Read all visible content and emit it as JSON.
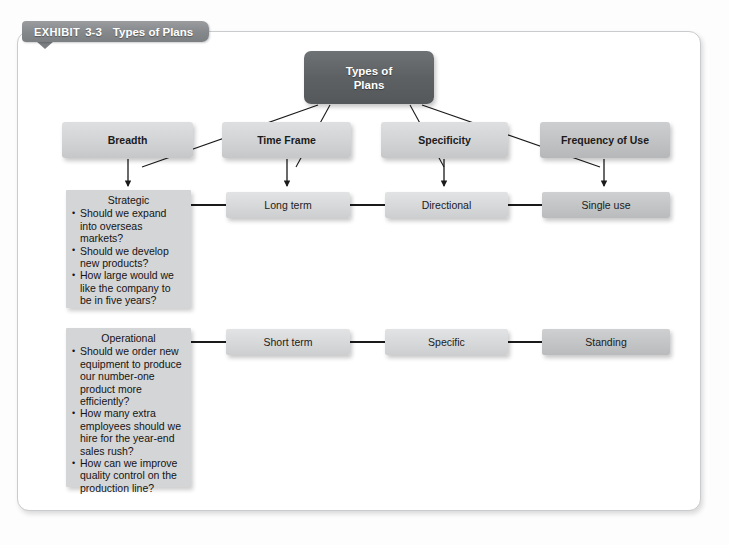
{
  "exhibit": {
    "label": "EXHIBIT",
    "number": "3-3",
    "title": "Types of Plans"
  },
  "colors": {
    "root_fill": "#5e6163",
    "category_fill": "#d2d3d4",
    "category_fill_dark": "#c1c2c3",
    "leaf_fill": "#d7d8d9",
    "leaf_fill_dark": "#c3c4c5",
    "panel_fill": "#d4d5d6",
    "banner_fill": "#85888b",
    "connector": "#1a1a1a",
    "card_border": "#c9cbcd"
  },
  "diagram": {
    "root": "Types of\nPlans",
    "root_line1": "Types of",
    "root_line2": "Plans",
    "categories": [
      {
        "label": "Breadth"
      },
      {
        "label": "Time Frame"
      },
      {
        "label": "Specificity"
      },
      {
        "label": "Frequency of Use"
      }
    ],
    "row_strategic": {
      "panel": {
        "title": "Strategic",
        "bullets": [
          "Should we expand into overseas markets?",
          "Should we develop new products?",
          "How large would we like the company to be in five years?"
        ]
      },
      "time_frame": "Long term",
      "specificity": "Directional",
      "frequency": "Single use"
    },
    "row_operational": {
      "panel": {
        "title": "Operational",
        "bullets": [
          "Should we order new equipment to produce our number-one product more efficiently?",
          "How many extra employees should we hire for the year-end sales rush?",
          "How can we improve quality control on the production line?"
        ]
      },
      "time_frame": "Short term",
      "specificity": "Specific",
      "frequency": "Standing"
    }
  }
}
